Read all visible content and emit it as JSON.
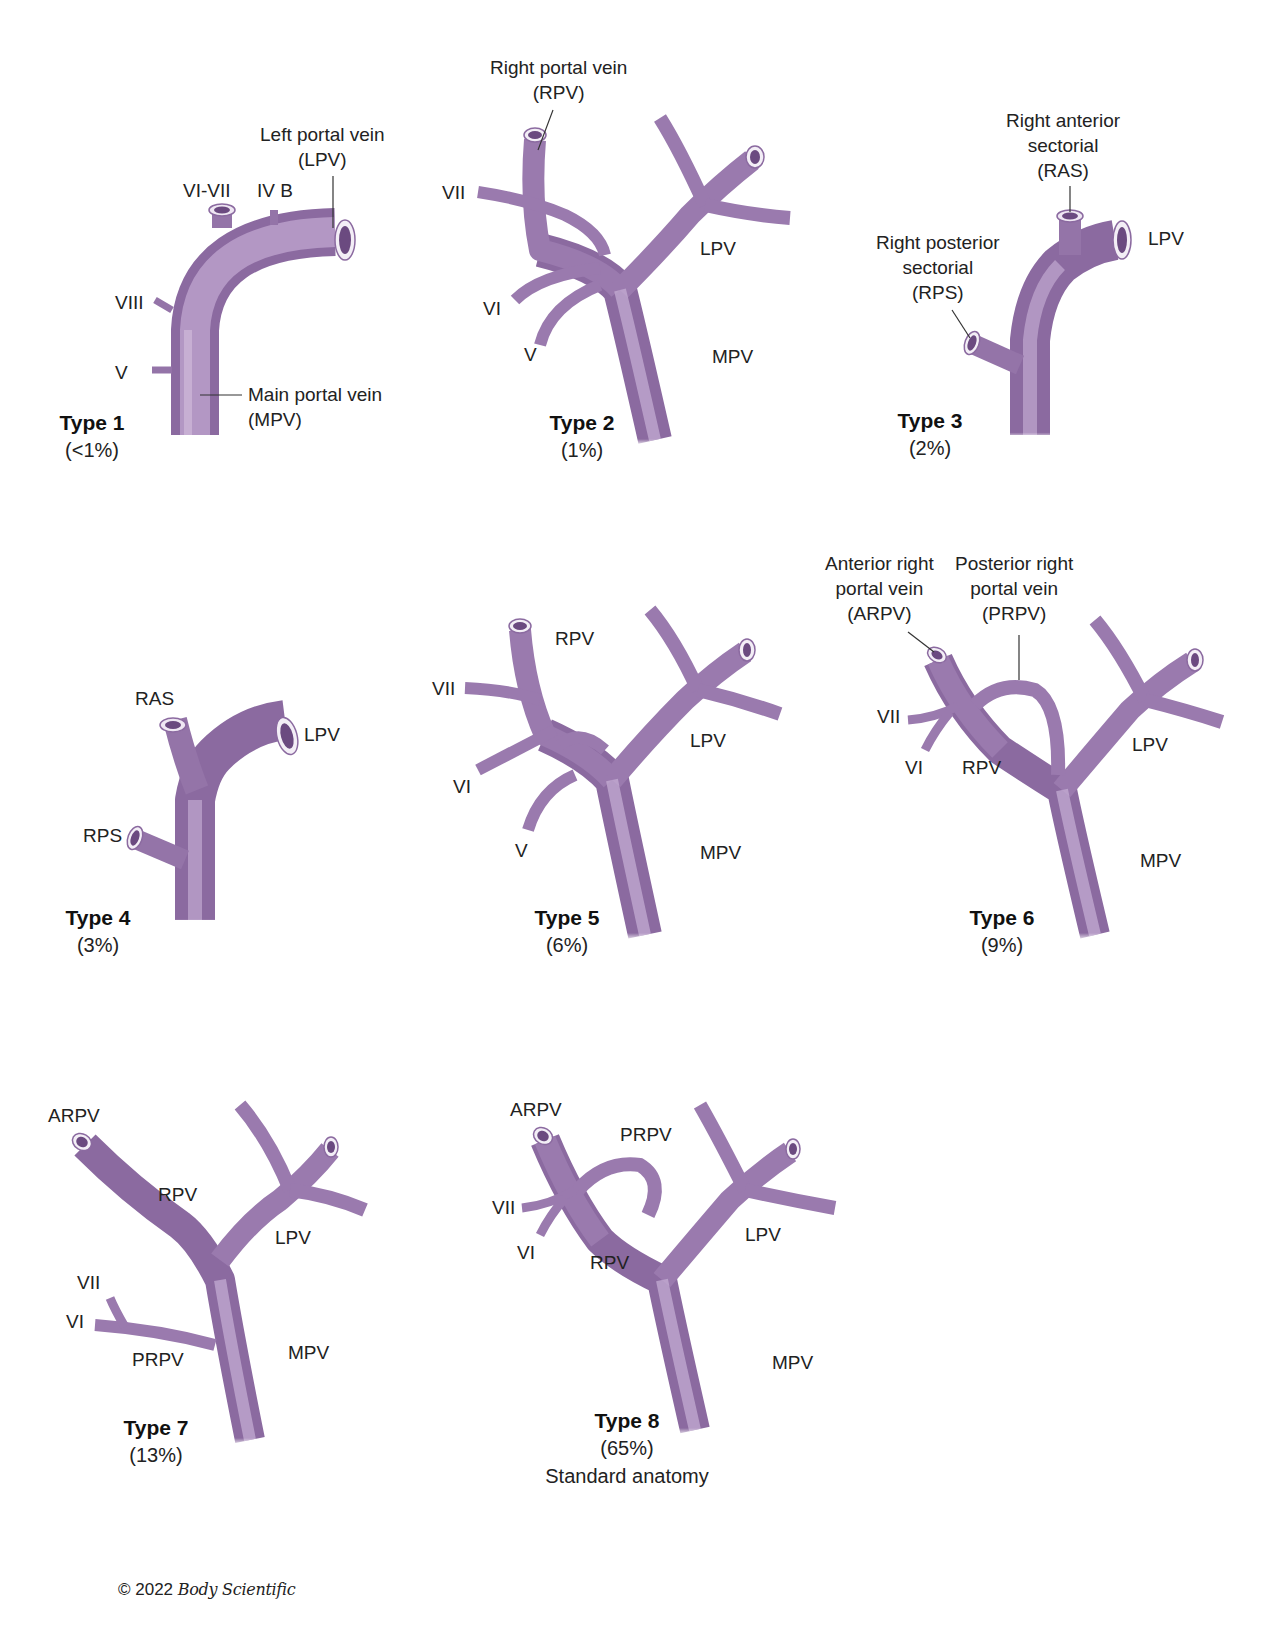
{
  "diagram_title": "Portal vein branching variants",
  "colors": {
    "vein": "#a27fb3",
    "vein_dark": "#7d5a92",
    "vein_light": "#cdb5d8",
    "lumen": "#6b4a80",
    "rim": "#f3eef6",
    "text": "#222222"
  },
  "panels": [
    {
      "id": "type1",
      "title": "Type 1",
      "percent": "(<1%)",
      "labels": {
        "lpv": [
          "Left portal vein",
          "(LPV)"
        ],
        "vi_vii": "VI-VII",
        "iv_b": "IV B",
        "viii": "VIII",
        "v": "V",
        "mpv": [
          "Main portal vein",
          "(MPV)"
        ]
      }
    },
    {
      "id": "type2",
      "title": "Type 2",
      "percent": "(1%)",
      "labels": {
        "rpv": [
          "Right portal vein",
          "(RPV)"
        ],
        "vii": "VII",
        "vi": "VI",
        "v": "V",
        "lpv": "LPV",
        "mpv": "MPV"
      }
    },
    {
      "id": "type3",
      "title": "Type 3",
      "percent": "(2%)",
      "labels": {
        "ras": [
          "Right anterior",
          "sectorial",
          "(RAS)"
        ],
        "rps": [
          "Right posterior",
          "sectorial",
          "(RPS)"
        ],
        "lpv": "LPV"
      }
    },
    {
      "id": "type4",
      "title": "Type 4",
      "percent": "(3%)",
      "labels": {
        "ras": "RAS",
        "rps": "RPS",
        "lpv": "LPV"
      }
    },
    {
      "id": "type5",
      "title": "Type 5",
      "percent": "(6%)",
      "labels": {
        "rpv": "RPV",
        "vii": "VII",
        "vi": "VI",
        "v": "V",
        "lpv": "LPV",
        "mpv": "MPV"
      }
    },
    {
      "id": "type6",
      "title": "Type 6",
      "percent": "(9%)",
      "labels": {
        "arpv": [
          "Anterior right",
          "portal vein",
          "(ARPV)"
        ],
        "prpv": [
          "Posterior right",
          "portal vein",
          "(PRPV)"
        ],
        "vii": "VII",
        "vi": "VI",
        "rpv": "RPV",
        "lpv": "LPV",
        "mpv": "MPV"
      }
    },
    {
      "id": "type7",
      "title": "Type 7",
      "percent": "(13%)",
      "labels": {
        "arpv": "ARPV",
        "rpv": "RPV",
        "lpv": "LPV",
        "vii": "VII",
        "vi": "VI",
        "prpv": "PRPV",
        "mpv": "MPV"
      }
    },
    {
      "id": "type8",
      "title": "Type 8",
      "percent": "(65%)",
      "note": "Standard anatomy",
      "labels": {
        "arpv": "ARPV",
        "prpv": "PRPV",
        "vii": "VII",
        "vi": "VI",
        "rpv": "RPV",
        "lpv": "LPV",
        "mpv": "MPV"
      }
    }
  ],
  "footer": {
    "copyright_prefix": "© 2022",
    "brand": "Body Scientific"
  }
}
